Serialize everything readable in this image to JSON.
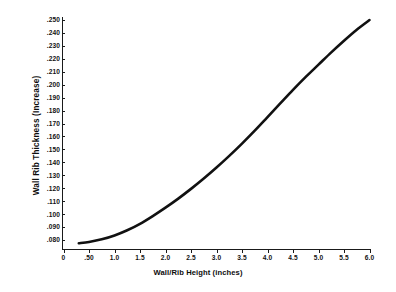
{
  "chart_data": {
    "type": "line",
    "title": "",
    "xlabel": "Wall/Rib Height (inches)",
    "ylabel": "Wall Rib Thickness (Increase)",
    "xlim": [
      0,
      6.0
    ],
    "ylim": [
      0.075,
      0.255
    ],
    "grid": false,
    "legend": null,
    "x_tick_labels": [
      "0",
      ".50",
      "1.0",
      "1.5",
      "2.0",
      "2.5",
      "3.0",
      "3.5",
      "4.0",
      "4.5",
      "5.0",
      "5.5",
      "6.0"
    ],
    "x_tick_values": [
      0,
      0.5,
      1.0,
      1.5,
      2.0,
      2.5,
      3.0,
      3.5,
      4.0,
      4.5,
      5.0,
      5.5,
      6.0
    ],
    "y_tick_labels": [
      ".250",
      ".240",
      ".230",
      ".220",
      ".210",
      ".200",
      ".190",
      ".180",
      ".170",
      ".160",
      ".150",
      ".140",
      ".130",
      ".120",
      ".110",
      ".100",
      ".090",
      ".080"
    ],
    "y_tick_values": [
      0.25,
      0.24,
      0.23,
      0.22,
      0.21,
      0.2,
      0.19,
      0.18,
      0.17,
      0.16,
      0.15,
      0.14,
      0.13,
      0.12,
      0.11,
      0.1,
      0.09,
      0.08
    ],
    "series": [
      {
        "name": "Wall Rib Thickness Increase",
        "color": "#111111",
        "x": [
          0.3,
          0.5,
          0.75,
          1.0,
          1.25,
          1.5,
          1.75,
          2.0,
          2.25,
          2.5,
          2.75,
          3.0,
          3.25,
          3.5,
          3.75,
          4.0,
          4.25,
          4.5,
          4.75,
          5.0,
          5.25,
          5.5,
          5.75,
          6.0
        ],
        "values": [
          0.0775,
          0.0785,
          0.0805,
          0.0835,
          0.0875,
          0.0925,
          0.0985,
          0.105,
          0.112,
          0.1195,
          0.1275,
          0.136,
          0.145,
          0.1545,
          0.1645,
          0.175,
          0.1855,
          0.196,
          0.206,
          0.2155,
          0.225,
          0.234,
          0.2425,
          0.25
        ]
      }
    ]
  },
  "axis_titles": {
    "x": "Wall/Rib Height (inches)",
    "y": "Wall Rib Thickness (Increase)"
  }
}
